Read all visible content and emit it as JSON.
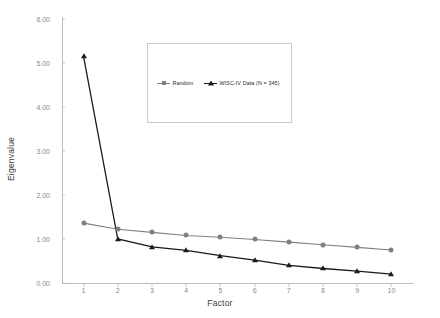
{
  "chart_data": {
    "type": "line",
    "title": "",
    "xlabel": "Factor",
    "ylabel": "Eigenvalue",
    "x": [
      1,
      2,
      3,
      4,
      5,
      6,
      7,
      8,
      9,
      10
    ],
    "xticklabels": [
      "1",
      "2",
      "3",
      "4",
      "5",
      "6",
      "7",
      "8",
      "9",
      "10"
    ],
    "yticklabels": [
      "0.00",
      "1.00",
      "2.00",
      "3.00",
      "4.00",
      "5.00",
      "6.00"
    ],
    "yticks": [
      0,
      1,
      2,
      3,
      4,
      5,
      6
    ],
    "xlim": [
      0.4,
      10.6
    ],
    "ylim": [
      0,
      6
    ],
    "grid": false,
    "legend_position": "upper-center",
    "series": [
      {
        "name": "Random",
        "values": [
          1.36,
          1.22,
          1.15,
          1.08,
          1.04,
          0.99,
          0.93,
          0.87,
          0.81,
          0.75
        ],
        "color": "#808080",
        "marker": "circle"
      },
      {
        "name": "WISC-IV Data (N = 345)",
        "values": [
          5.15,
          1.0,
          0.82,
          0.74,
          0.62,
          0.52,
          0.4,
          0.33,
          0.27,
          0.2
        ],
        "color": "#1a1a1a",
        "marker": "triangle"
      }
    ]
  },
  "axes": {
    "x_title": "Factor",
    "y_title": "Eigenvalue"
  },
  "colors": {
    "random": "#808080",
    "wisc": "#1a1a1a",
    "axis": "#bdbdbd",
    "tick_text": "#8a8a8a",
    "legend_border": "#c9c9c9"
  }
}
